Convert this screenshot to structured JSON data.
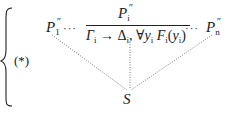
{
  "figure": {
    "label": "(*)",
    "left_premise": {
      "base": "P",
      "prime": "″",
      "sub": "1"
    },
    "ellipsis": "···",
    "right_premise": {
      "base": "P",
      "prime": "″",
      "sub": "n"
    },
    "inference": {
      "numerator": {
        "base": "P",
        "prime": "″",
        "sub": "i"
      },
      "denominator": {
        "gamma": "Γ",
        "gamma_sub": "i",
        "arrow": "→",
        "delta": "Δ",
        "delta_sub": "i",
        "comma": ",",
        "forall": "∀",
        "y": "y",
        "y_sub": "i",
        "F": "F",
        "F_sub": "i",
        "arg_open": "(",
        "arg_y": "y",
        "arg_sub": "i",
        "arg_close": ")"
      }
    },
    "conclusion": "S"
  }
}
